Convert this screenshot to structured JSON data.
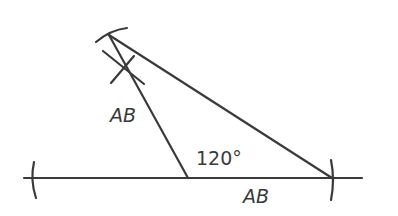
{
  "diagram": {
    "stroke_color": "#3a3a3a",
    "labels": {
      "side_upper": "AB",
      "angle": "120°",
      "side_lower": "AB"
    },
    "points": {
      "vertex": [
        188,
        178
      ],
      "apex": [
        109,
        35
      ],
      "right_end": [
        332,
        178
      ]
    }
  }
}
